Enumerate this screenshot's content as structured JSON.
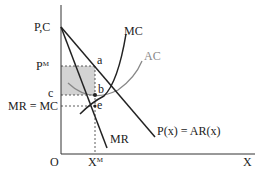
{
  "diagram": {
    "axes": {
      "y_label": "P,C",
      "x_label": "X",
      "origin_label": "O"
    },
    "curves": [
      {
        "name": "MC",
        "label": "MC",
        "color": "#222222"
      },
      {
        "name": "AC",
        "label": "AC",
        "color": "#888888"
      },
      {
        "name": "MR",
        "label": "MR",
        "color": "#222222"
      },
      {
        "name": "demand",
        "label": "P(x) = AR(x)",
        "color": "#222222"
      }
    ],
    "points": [
      {
        "label": "a"
      },
      {
        "label": "b"
      },
      {
        "label": "e"
      }
    ],
    "y_ticks": {
      "price": {
        "base": "P",
        "sup": "M"
      },
      "cost": "c",
      "mr_mc": "MR = MC"
    },
    "x_ticks": {
      "quantity": {
        "base": "X",
        "sup": "M"
      }
    },
    "shaded_region": {
      "description": "profit rectangle",
      "color": "#d3d3d3"
    }
  }
}
